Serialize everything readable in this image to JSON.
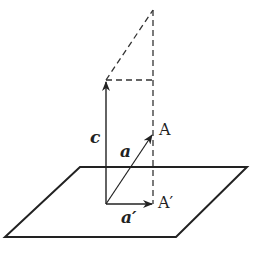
{
  "diagram": {
    "labels": {
      "c": "c",
      "a": "a",
      "a_prime": "a′",
      "A": "A",
      "A_prime": "A′"
    },
    "colors": {
      "stroke": "#222222",
      "dash": "#333333",
      "background": "#ffffff"
    }
  }
}
